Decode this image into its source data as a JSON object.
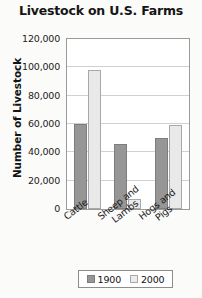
{
  "chart_data": {
    "type": "bar",
    "title": "Livestock on U.S. Farms",
    "xlabel": "",
    "ylabel": "Number of Livestock",
    "categories": [
      "Cattle",
      "Sheep and Lambs",
      "Hogs and Pigs"
    ],
    "category_lines": [
      [
        "Cattle"
      ],
      [
        "Sheep and",
        "Lambs"
      ],
      [
        "Hogs and",
        "Pigs"
      ]
    ],
    "series": [
      {
        "name": "1900",
        "color": "#969696",
        "values": [
          60000,
          46000,
          50000
        ]
      },
      {
        "name": "2000",
        "color": "#e9e9e9",
        "values": [
          98000,
          7000,
          59000
        ]
      }
    ],
    "ylim": [
      0,
      120000
    ],
    "ytick_values": [
      0,
      20000,
      40000,
      60000,
      80000,
      100000,
      120000
    ],
    "ytick_labels": [
      "0",
      "20,000",
      "40,000",
      "60,000",
      "80,000",
      "100,000",
      "120,000"
    ],
    "grid": true,
    "legend_position": "bottom",
    "legend_entries": [
      "1900",
      "2000"
    ]
  }
}
